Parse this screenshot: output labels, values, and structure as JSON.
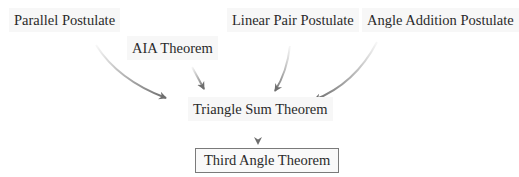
{
  "diagram": {
    "type": "flow / dependency diagram",
    "nodes": [
      {
        "id": "parallel",
        "label": "Parallel Postulate",
        "boxed": false
      },
      {
        "id": "aia",
        "label": "AIA Theorem",
        "boxed": false
      },
      {
        "id": "linear_pair",
        "label": "Linear Pair Postulate",
        "boxed": false
      },
      {
        "id": "angle_addition",
        "label": "Angle Addition Postulate",
        "boxed": false
      },
      {
        "id": "triangle_sum",
        "label": "Triangle Sum Theorem",
        "boxed": false
      },
      {
        "id": "third_angle",
        "label": "Third Angle Theorem",
        "boxed": true
      }
    ],
    "edges": [
      {
        "from": "parallel",
        "to": "triangle_sum"
      },
      {
        "from": "aia",
        "to": "triangle_sum"
      },
      {
        "from": "linear_pair",
        "to": "triangle_sum"
      },
      {
        "from": "angle_addition",
        "to": "triangle_sum"
      },
      {
        "from": "triangle_sum",
        "to": "third_angle"
      }
    ],
    "colors": {
      "text": "#2a2a2a",
      "arrow": "#6e6e6e",
      "box_border": "#7a7a7a",
      "label_bg": "#f7f7f7"
    }
  }
}
